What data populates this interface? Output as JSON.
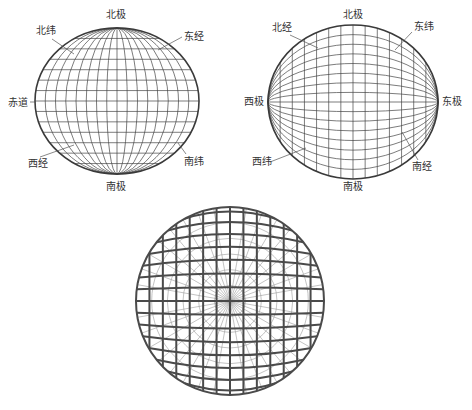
{
  "figure": {
    "width": 472,
    "height": 410,
    "colors": {
      "line": "#444444",
      "rim": "#3a3a3a",
      "faint": "#9a9a9a",
      "text": "#333333"
    }
  },
  "sphere_a": {
    "title": "vertical-axis globe",
    "cx": 117,
    "cy": 101,
    "rx": 82,
    "ry": 73,
    "meridians": 16,
    "parallels": 14,
    "labels": [
      {
        "key": "north_pole",
        "text": "北极",
        "x": 106,
        "y": 18,
        "lx1": null
      },
      {
        "key": "north_lat",
        "text": "北纬",
        "x": 36,
        "y": 34,
        "lx1": 52,
        "ly1": 39,
        "lx2": 74,
        "ly2": 54
      },
      {
        "key": "east_long",
        "text": "东经",
        "x": 184,
        "y": 40,
        "lx1": 182,
        "ly1": 37,
        "lx2": 158,
        "ly2": 50
      },
      {
        "key": "equator",
        "text": "赤道",
        "x": 8,
        "y": 106,
        "lx1": 30,
        "ly1": 102,
        "lx2": 36,
        "ly2": 102
      },
      {
        "key": "west_long",
        "text": "西经",
        "x": 28,
        "y": 167,
        "lx1": 40,
        "ly1": 157,
        "lx2": 74,
        "ly2": 145
      },
      {
        "key": "south_lat",
        "text": "南纬",
        "x": 184,
        "y": 165,
        "lx1": 186,
        "ly1": 154,
        "lx2": 178,
        "ly2": 143
      },
      {
        "key": "south_pole",
        "text": "南极",
        "x": 106,
        "y": 190,
        "lx1": null
      }
    ]
  },
  "sphere_b": {
    "title": "horizontal-axis globe",
    "cx": 353,
    "cy": 102,
    "rx": 85,
    "ry": 77,
    "meridians": 16,
    "parallels": 14,
    "labels": [
      {
        "key": "north_pole",
        "text": "北极",
        "x": 343,
        "y": 18,
        "lx1": null
      },
      {
        "key": "north_long",
        "text": "北经",
        "x": 272,
        "y": 31,
        "lx1": 290,
        "ly1": 35,
        "lx2": 318,
        "ly2": 48
      },
      {
        "key": "east_lat",
        "text": "东纬",
        "x": 414,
        "y": 30,
        "lx1": 412,
        "ly1": 32,
        "lx2": 395,
        "ly2": 50
      },
      {
        "key": "west_pole",
        "text": "西极",
        "x": 244,
        "y": 105,
        "lx1": null
      },
      {
        "key": "east_pole",
        "text": "东极",
        "x": 442,
        "y": 105,
        "lx1": null
      },
      {
        "key": "west_lat",
        "text": "西纬",
        "x": 252,
        "y": 165,
        "lx1": 270,
        "ly1": 162,
        "lx2": 306,
        "ly2": 148
      },
      {
        "key": "south_long",
        "text": "南经",
        "x": 412,
        "y": 170,
        "lx1": 418,
        "ly1": 160,
        "lx2": 402,
        "ly2": 132
      },
      {
        "key": "south_pole",
        "text": "南极",
        "x": 343,
        "y": 190,
        "lx1": null
      }
    ]
  },
  "sphere_c": {
    "title": "pole-facing globe with radial meridians",
    "cx": 230,
    "cy": 301,
    "r": 94,
    "vertical_lines": 14,
    "parallels": 16,
    "radial_spokes": 36
  }
}
